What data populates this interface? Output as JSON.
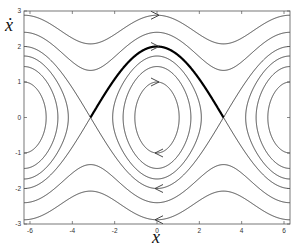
{
  "chart_data": {
    "type": "line",
    "title": "",
    "xlabel": "x",
    "ylabel": "ẋ",
    "xlim": [
      -6.2832,
      6.2832
    ],
    "ylim": [
      -3,
      3
    ],
    "grid": false,
    "xticks": [
      -6,
      -4,
      -2,
      0,
      2,
      4,
      6
    ],
    "yticks": [
      -3,
      -2,
      -1,
      0,
      1,
      2,
      3
    ],
    "xtick_labels": [
      "-6",
      "-4",
      "-2",
      "0",
      "2",
      "4",
      "6"
    ],
    "ytick_labels": [
      "-3",
      "-2",
      "-1",
      "0",
      "1",
      "2",
      "3"
    ],
    "series": [
      {
        "name": "closed orbit",
        "energy": -0.5,
        "kind": "libration"
      },
      {
        "name": "closed orbit",
        "energy": 0.03,
        "kind": "libration"
      },
      {
        "name": "closed orbit",
        "energy": 0.5,
        "kind": "libration"
      },
      {
        "name": "separatrix",
        "energy": 1.0,
        "kind": "separatrix",
        "highlight": "upper arc from -π to π (thick)"
      },
      {
        "name": "rotation",
        "energy": 1.88,
        "kind": "rotation"
      },
      {
        "name": "rotation",
        "energy": 3.15,
        "kind": "rotation"
      }
    ],
    "arrows": [
      {
        "x": 0,
        "y": 2.88,
        "direction": "right"
      },
      {
        "x": 0,
        "y": 2.0,
        "direction": "right"
      },
      {
        "x": 0,
        "y": 1.0,
        "direction": "right"
      },
      {
        "x": 0,
        "y": -1.0,
        "direction": "left"
      },
      {
        "x": 0,
        "y": -2.0,
        "direction": "left"
      },
      {
        "x": 0,
        "y": -2.88,
        "direction": "left"
      }
    ]
  },
  "labels": {
    "x_axis": "x",
    "y_axis": "ẋ"
  },
  "style": {
    "curve_color": "#333333",
    "frame_color": "#555555",
    "highlight_color": "#000000"
  }
}
